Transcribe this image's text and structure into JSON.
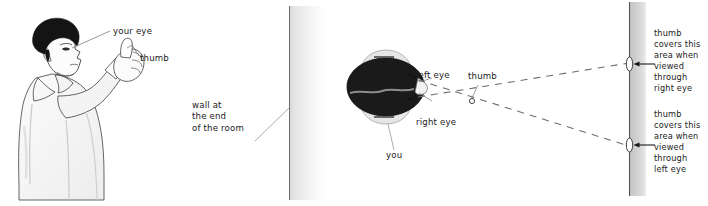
{
  "figure": {
    "panels": [
      {
        "name": "person-panel",
        "description": "side view of a person holding up a thumb at arm's length"
      },
      {
        "name": "overhead-panel",
        "description": "overhead view of head, thumb and sight lines to the far wall"
      }
    ]
  },
  "labels": {
    "your_eye": "your eye",
    "thumb_left": "thumb",
    "wall_caption": "wall at\nthe end\nof the room",
    "wall_caption_lines": [
      "wall at",
      "the end",
      "of the room"
    ],
    "left_eye": "left eye",
    "right_eye": "right eye",
    "thumb_top": "thumb",
    "you": "you",
    "note_right_lines": [
      "thumb",
      "covers this",
      "area when",
      "viewed",
      "through",
      "right eye"
    ],
    "note_left_lines": [
      "thumb",
      "covers this",
      "area when",
      "viewed",
      "through",
      "left eye"
    ],
    "note_right": "thumb covers this area when viewed through right eye",
    "note_left": "thumb covers this area when viewed through left eye"
  },
  "colors": {
    "ink": "#1b1b1b",
    "line": "#4a4a4a",
    "hair": "#141414",
    "skin_outline": "#3c3c3c",
    "garment_shade": "#e9e9e9",
    "head_halo": "#e4e4e4",
    "wall_gray": "#c9c9c9",
    "dash": "#6b6b6b",
    "background": "#ffffff"
  },
  "geometry": {
    "left_wall_x": 289,
    "right_wall_x": 629,
    "thumb_point": [
      472,
      101
    ],
    "left_eye_point": [
      409,
      83
    ],
    "right_eye_point": [
      409,
      104
    ],
    "right_marker_top": [
      629,
      65
    ],
    "right_marker_bottom": [
      629,
      145
    ]
  }
}
